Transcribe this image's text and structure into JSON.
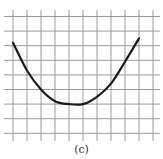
{
  "figure": {
    "caption": "(c)"
  },
  "chart_data": {
    "type": "line",
    "title": "",
    "subtitle": "",
    "xlabel": "",
    "ylabel": "",
    "grid": true,
    "legend": null,
    "grid_cells": {
      "columns": 11,
      "rows": 9
    },
    "x": [
      0,
      1,
      2,
      3,
      4,
      5,
      6,
      7,
      8,
      9
    ],
    "values": [
      6.2,
      4.3,
      3.0,
      2.2,
      2.0,
      2.0,
      2.5,
      3.4,
      4.9,
      6.5
    ],
    "xlim": [
      0,
      11
    ],
    "ylim": [
      0,
      9
    ],
    "colors": {
      "curve": "#1a1a1a",
      "grid": "#9a9a9a"
    }
  }
}
